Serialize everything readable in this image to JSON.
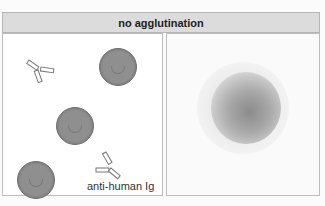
{
  "title": "no agglutination",
  "left_panel": {
    "description": "red blood cells and free antibodies",
    "cells": [
      {
        "x": 96,
        "y": 17,
        "d": 38
      },
      {
        "x": 53,
        "y": 75,
        "d": 38
      },
      {
        "x": 14,
        "y": 128,
        "d": 38
      }
    ],
    "antibodies": [
      {
        "x": 25,
        "y": 28,
        "rotate": 0
      },
      {
        "x": 93,
        "y": 118,
        "rotate": 180
      }
    ],
    "label": "anti-human Ig"
  },
  "right_panel": {
    "description": "diffuse cell button (negative result)"
  },
  "colors": {
    "header_bg": "#dcdcdc",
    "cell_fill": "#8f8f8f",
    "border": "#b5b5b5"
  }
}
